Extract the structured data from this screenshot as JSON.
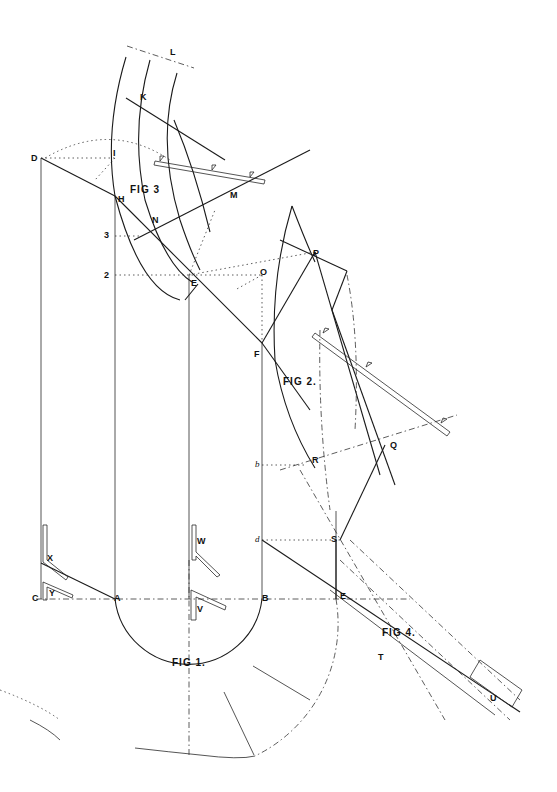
{
  "drawing": {
    "figures": {
      "fig1": "FIG 1.",
      "fig2": "FIG 2.",
      "fig3": "FIG 3",
      "fig4": "FIG 4."
    },
    "points": {
      "A": "A",
      "B": "B",
      "C": "C",
      "D": "D",
      "E": "E",
      "E2": "E",
      "F": "F",
      "H": "H",
      "I": "I",
      "K": "K",
      "L": "L",
      "M": "M",
      "N": "N",
      "O": "O",
      "P": "P",
      "Q": "Q",
      "R": "R",
      "S": "S",
      "T": "T",
      "U": "U",
      "V": "V",
      "W": "W",
      "X": "X",
      "Y": "Y"
    },
    "scale_marks": {
      "m2": "2",
      "m3": "3",
      "mb": "b",
      "md": "d"
    },
    "colors": {
      "ink": "#1a1a1a",
      "paper": "#ffffff"
    }
  }
}
